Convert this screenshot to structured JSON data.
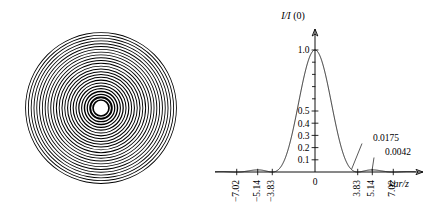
{
  "figure": {
    "title": "",
    "panels": [
      {
        "name": "airy-disk-pattern",
        "caption": ""
      },
      {
        "name": "airy-intensity-profile",
        "caption": ""
      }
    ]
  },
  "airy_pattern": {
    "name": "concentric-ring-diffraction-pattern",
    "center_x": 101,
    "center_y": 108,
    "outer_radius": 88,
    "ring_count": 26,
    "fill": "#000000",
    "background": "#ffffff"
  },
  "chart_data": {
    "type": "line",
    "title": "",
    "subtitle": "",
    "xlabel": "kar/z",
    "ylabel": "I/I (0)",
    "ylabel_parts": {
      "numerator": "I",
      "denominator": "I",
      "argument": "(0)"
    },
    "xlim": [
      -9.0,
      9.0
    ],
    "ylim": [
      0.0,
      1.08
    ],
    "grid": false,
    "legend": null,
    "x_ticks": [
      -7.02,
      -5.14,
      -3.83,
      0,
      3.83,
      5.14,
      7.02
    ],
    "x_tick_labels": [
      "−7.02",
      "−5.14",
      "−3.83",
      "0",
      "3.83",
      "5.14",
      "7.02"
    ],
    "x_tick_label_rotation": -90,
    "y_ticks": [
      0.1,
      0.2,
      0.3,
      0.4,
      0.5,
      1.0
    ],
    "y_tick_labels": [
      "0.1",
      "0.2",
      "0.3",
      "0.4",
      "0.5",
      "1.0"
    ],
    "y_minor_ticks": [
      0.6,
      0.7,
      0.8,
      0.9
    ],
    "function": "Airy: (2*J1(x)/x)^2",
    "peak_value": 1.0,
    "peak_x": 0,
    "annotations": [
      {
        "label": "0.0175",
        "points_to_x": 5.14,
        "points_to_y": 0.0175
      },
      {
        "label": "0.0042",
        "points_to_x": 7.02,
        "points_to_y": 0.0042
      }
    ],
    "series": [
      {
        "name": "airy-intensity",
        "values_description": "normalized intensity I/I(0) vs kar/z",
        "zeros": [
          -8.42,
          -7.02,
          -5.14,
          -3.83,
          3.83,
          5.14,
          7.02,
          8.42
        ],
        "side_lobe_maxima": [
          {
            "x": -5.14,
            "y": 0.0175
          },
          {
            "x": -7.02,
            "y": 0.0042
          },
          {
            "x": 5.14,
            "y": 0.0175
          },
          {
            "x": 7.02,
            "y": 0.0042
          }
        ]
      }
    ]
  }
}
